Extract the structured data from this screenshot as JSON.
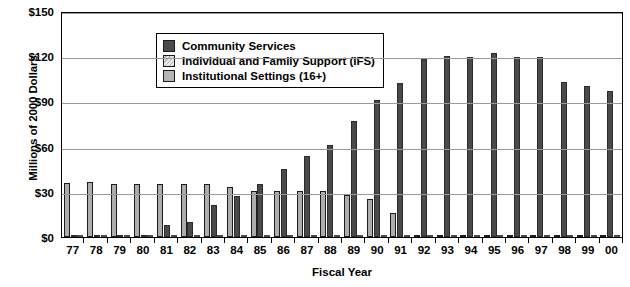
{
  "chart_data": {
    "type": "bar",
    "title": "",
    "xlabel": "Fiscal Year",
    "ylabel": "Millions of 2000 Dollars",
    "ylim": [
      0,
      150
    ],
    "yticks": [
      0,
      30,
      60,
      90,
      120,
      150
    ],
    "ytick_labels": [
      "$0",
      "$30",
      "$60",
      "$90",
      "$120",
      "$150"
    ],
    "grid": true,
    "legend_position": "upper-left-inside",
    "categories": [
      "77",
      "78",
      "79",
      "80",
      "81",
      "82",
      "83",
      "84",
      "85",
      "86",
      "87",
      "88",
      "89",
      "90",
      "91",
      "92",
      "93",
      "94",
      "95",
      "96",
      "97",
      "98",
      "99",
      "00"
    ],
    "series": [
      {
        "name": "Community Services",
        "color": "#4a4a4a",
        "values": [
          1.0,
          1.0,
          1.5,
          1.5,
          8.0,
          10.0,
          21.0,
          27.0,
          35.0,
          45.0,
          54.0,
          61.0,
          77.0,
          91.0,
          102.0,
          118.0,
          120.0,
          119.5,
          122.0,
          119.5,
          119.5,
          103.0,
          100.0,
          97.0
        ]
      },
      {
        "name": "Individual and Family Support (IFS)",
        "color": "#e2e2e2",
        "values": [
          0.3,
          0.3,
          0.3,
          0.3,
          0.3,
          0.3,
          0.3,
          0.3,
          0.4,
          0.4,
          0.4,
          0.5,
          0.8,
          1.0,
          1.3,
          0.6,
          0.4,
          0.4,
          0.4,
          0.4,
          0.4,
          0.6,
          1.5,
          1.2
        ]
      },
      {
        "name": "Institutional Settings (16+)",
        "color": "#adadad",
        "values": [
          36.0,
          36.5,
          35.0,
          35.0,
          35.5,
          35.0,
          35.5,
          33.5,
          30.5,
          30.5,
          30.5,
          30.5,
          28.0,
          25.0,
          16.0,
          0.5,
          0.4,
          0.4,
          0.4,
          0.4,
          0.4,
          0.4,
          1.0,
          0.8
        ]
      }
    ],
    "series_draw_order": [
      "Institutional Settings (16+)",
      "Community Services",
      "Individual and Family Support (IFS)"
    ]
  },
  "legend": {
    "items": [
      {
        "label": "Community Services",
        "key": "comm"
      },
      {
        "label": "Individual and Family Support (IFS)",
        "key": "ifs"
      },
      {
        "label": "Institutional Settings (16+)",
        "key": "inst"
      }
    ]
  },
  "axes": {
    "y_title": "Millions of 2000 Dollars",
    "x_title": "Fiscal Year"
  }
}
